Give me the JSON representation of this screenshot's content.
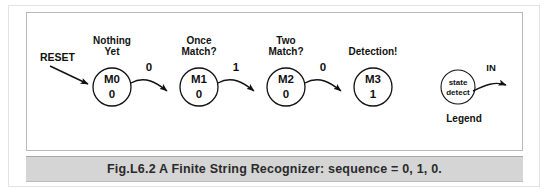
{
  "figure": {
    "caption": "Fig.L6.2 A Finite String Recognizer: sequence  = 0, 1, 0.",
    "reset_label": "RESET"
  },
  "states": [
    {
      "id": "M0",
      "output": "0",
      "caption_line1": "Nothing",
      "caption_line2": "Yet"
    },
    {
      "id": "M1",
      "output": "0",
      "caption_line1": "Once",
      "caption_line2": "Match?"
    },
    {
      "id": "M2",
      "output": "0",
      "caption_line1": "Two",
      "caption_line2": "Match?"
    },
    {
      "id": "M3",
      "output": "1",
      "caption_line1": "Detection!",
      "caption_line2": ""
    }
  ],
  "transitions": [
    {
      "from": "M0",
      "to": "M1",
      "label": "0"
    },
    {
      "from": "M1",
      "to": "M2",
      "label": "1"
    },
    {
      "from": "M2",
      "to": "M3",
      "label": "0"
    }
  ],
  "legend": {
    "circle_line1": "state",
    "circle_line2": "detect",
    "input_label": "IN",
    "title": "Legend"
  },
  "colors": {
    "ink": "#111111",
    "panel_background": "#ffffff",
    "panel_border": "#b9b9b9",
    "outer_border": "#e3e3e3",
    "caption_background": "#d5d5d5"
  }
}
